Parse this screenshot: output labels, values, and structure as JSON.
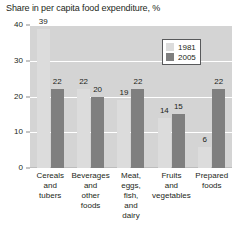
{
  "chart_data": {
    "type": "bar",
    "title": "Share in per capita food expenditure, %",
    "xlabel": "",
    "ylabel": "",
    "ylim": [
      0,
      40
    ],
    "yticks": [
      0,
      10,
      20,
      30,
      40
    ],
    "grid": true,
    "legend_position": "top-right",
    "categories": [
      "Cereals and tubers",
      "Beverages and other foods",
      "Meat, eggs, fish, and dairy",
      "Fruits and vegetables",
      "Prepared foods"
    ],
    "category_lines": [
      [
        "Cereals",
        "and",
        "tubers"
      ],
      [
        "Beverages",
        "and",
        "other",
        "foods"
      ],
      [
        "Meat,",
        "eggs,",
        "fish,",
        "and",
        "dairy"
      ],
      [
        "Fruits",
        "and",
        "vegetables"
      ],
      [
        "Prepared",
        "foods"
      ]
    ],
    "series": [
      {
        "name": "1981",
        "color": "#dcdcdc",
        "values": [
          39,
          22,
          19,
          14,
          6
        ]
      },
      {
        "name": "2005",
        "color": "#7f7f7f",
        "values": [
          22,
          20,
          22,
          15,
          22
        ]
      }
    ]
  },
  "legend": {
    "items": [
      {
        "label": "1981"
      },
      {
        "label": "2005"
      }
    ]
  },
  "colors": {
    "plot_background": "#d4d4d4",
    "gridline": "#ffffff",
    "series_1981": "#dcdcdc",
    "series_2005": "#7f7f7f",
    "text": "#231f20"
  }
}
